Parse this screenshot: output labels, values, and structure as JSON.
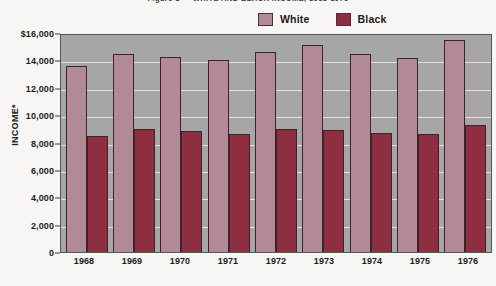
{
  "chart_data": {
    "type": "bar",
    "title": "Figure 1 — WHITE AND BLACK INCOME, 1968-1976",
    "xlabel": "",
    "ylabel": "INCOME*",
    "ylim": [
      0,
      16000
    ],
    "grid": true,
    "legend_position": "top-right",
    "categories": [
      "1968",
      "1969",
      "1970",
      "1971",
      "1972",
      "1973",
      "1974",
      "1975",
      "1976"
    ],
    "series": [
      {
        "name": "White",
        "color": "#b28a95",
        "values": [
          13600,
          14450,
          14250,
          14050,
          14600,
          15100,
          14500,
          14150,
          15500
        ]
      },
      {
        "name": "Black",
        "color": "#8e2e41",
        "values": [
          8500,
          9000,
          8850,
          8600,
          9000,
          8950,
          8700,
          8650,
          9250
        ]
      }
    ],
    "y_ticks": [
      {
        "value": 16000,
        "label": "$16,000"
      },
      {
        "value": 14000,
        "label": "14,000"
      },
      {
        "value": 12000,
        "label": "12,000"
      },
      {
        "value": 10000,
        "label": "10,000"
      },
      {
        "value": 8000,
        "label": "8,000"
      },
      {
        "value": 6000,
        "label": "6,000"
      },
      {
        "value": 4000,
        "label": "4,000"
      },
      {
        "value": 2000,
        "label": "2,000"
      },
      {
        "value": 0,
        "label": "0"
      }
    ]
  }
}
